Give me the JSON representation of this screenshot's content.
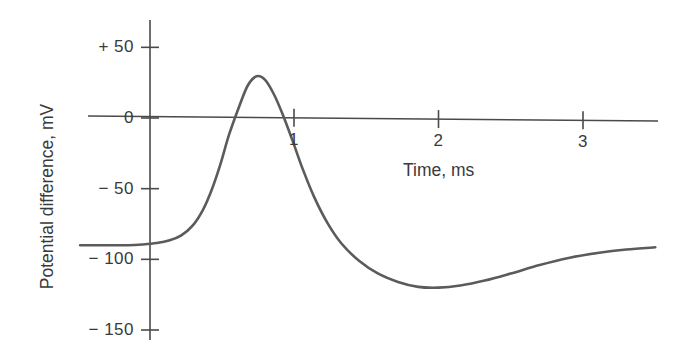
{
  "chart_data": {
    "type": "line",
    "title": "",
    "subtitle": "",
    "xlabel": "Time, ms",
    "ylabel": "Potential difference, mV",
    "xlim": [
      -0.48,
      3.5
    ],
    "ylim": [
      -165,
      60
    ],
    "xticks": [
      1,
      2,
      3
    ],
    "xtick_labels": [
      "1",
      "2",
      "3"
    ],
    "yticks": [
      50,
      0,
      -50,
      -100,
      -150
    ],
    "ytick_labels": [
      "+ 50",
      "0",
      "− 50",
      "− 100",
      "− 150"
    ],
    "grid": false,
    "legend": null,
    "legend_position": "none",
    "annotations": [],
    "series": [
      {
        "name": "Action potential",
        "color": "#5b5b5b",
        "line_width": 2.6,
        "x": [
          -0.48,
          -0.3,
          -0.15,
          -0.05,
          0.05,
          0.14,
          0.22,
          0.3,
          0.37,
          0.43,
          0.49,
          0.55,
          0.62,
          0.68,
          0.74,
          0.8,
          0.86,
          0.92,
          0.99,
          1.06,
          1.14,
          1.23,
          1.33,
          1.45,
          1.58,
          1.72,
          1.86,
          2.0,
          2.15,
          2.32,
          2.5,
          2.7,
          2.9,
          3.1,
          3.3,
          3.5
        ],
        "y": [
          -90,
          -90,
          -90,
          -89.5,
          -88.5,
          -86.5,
          -83,
          -76,
          -65,
          -51,
          -33,
          -12,
          8,
          23,
          29.5,
          27,
          17,
          3,
          -16,
          -36,
          -56,
          -74,
          -89,
          -101,
          -110,
          -116,
          -119.5,
          -120,
          -118.5,
          -115,
          -110,
          -104,
          -99,
          -95.5,
          -93,
          -91.5
        ]
      }
    ]
  },
  "axes": {
    "y_axis_line": {
      "x": 150,
      "y_top": 20,
      "y_bottom": 340
    },
    "x_axis_line": {
      "y_left": 116,
      "y_right": 121,
      "x_left": 88,
      "x_right": 658
    },
    "axis_color": "#4a4a4a",
    "tick_length": 9
  },
  "figure": {
    "background_color": "#ffffff",
    "width": 688,
    "height": 354
  }
}
